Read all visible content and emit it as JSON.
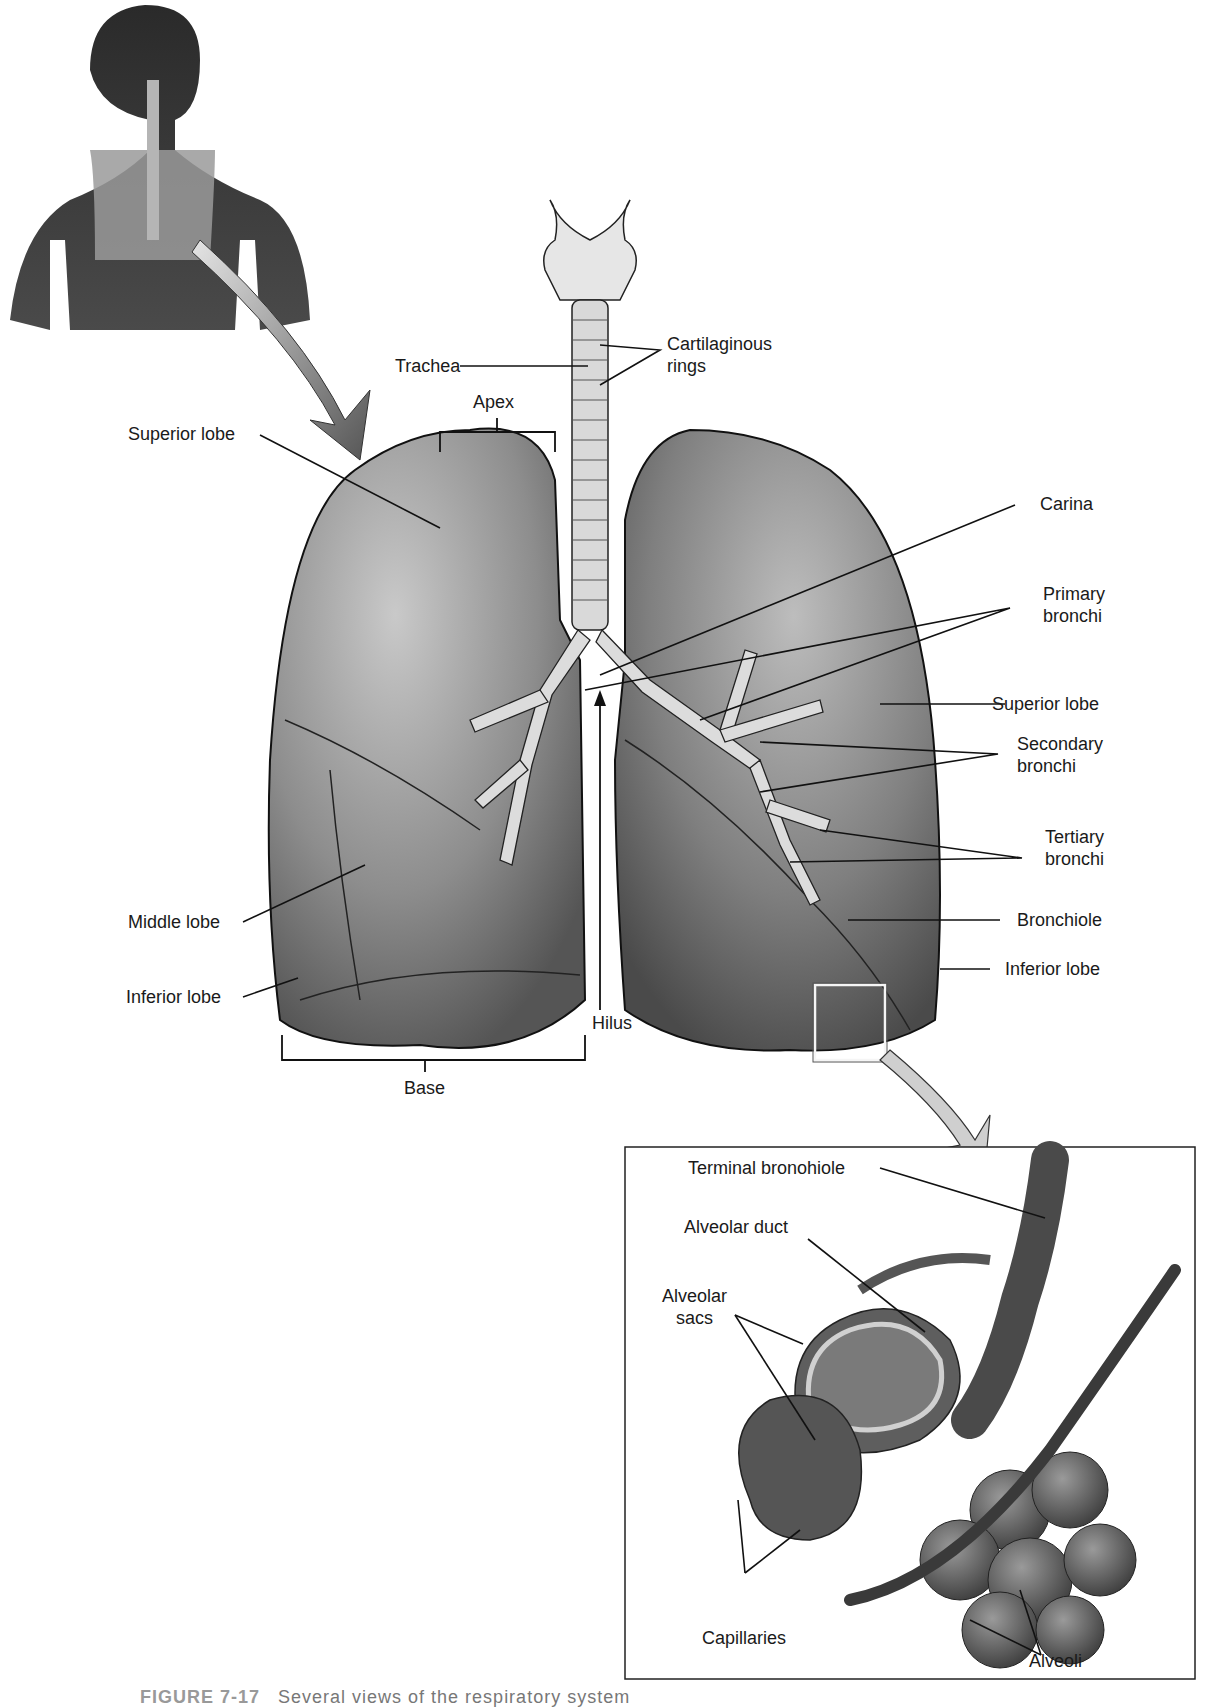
{
  "figure": {
    "caption_number": "FIGURE 7-17",
    "caption_text": "Several views of the respiratory system",
    "caption_truncated": true
  },
  "thumbnail": {
    "description": "Human torso showing lungs and airway in situ"
  },
  "main_diagram": {
    "labels_left": {
      "superior_lobe": "Superior lobe",
      "apex": "Apex",
      "trachea": "Trachea",
      "middle_lobe": "Middle lobe",
      "inferior_lobe": "Inferior lobe",
      "base": "Base",
      "hilus": "Hilus"
    },
    "labels_right": {
      "cartilaginous_rings": [
        "Cartilaginous",
        "rings"
      ],
      "carina": "Carina",
      "primary_bronchi": [
        "Primary",
        "bronchi"
      ],
      "superior_lobe": "Superior lobe",
      "secondary_bronchi": [
        "Secondary",
        "bronchi"
      ],
      "tertiary_bronchi": [
        "Tertiary",
        "bronchi"
      ],
      "bronchiole": "Bronchiole",
      "inferior_lobe": "Inferior lobe"
    }
  },
  "inset": {
    "labels": {
      "terminal_bronchiole": "Terminal bronohiole",
      "alveolar_duct": "Alveolar duct",
      "alveolar_sacs": [
        "Alveolar",
        "sacs"
      ],
      "capillaries": "Capillaries",
      "alveoli": "Alveoli"
    }
  },
  "colors": {
    "background": "#ffffff",
    "text": "#1a1a1a",
    "lung_dark": "#5a5a5a",
    "lung_mid": "#8c8c8c",
    "lung_light": "#c8c8c8",
    "airway": "#d9d9d9",
    "skin": "#3a3a3a"
  }
}
